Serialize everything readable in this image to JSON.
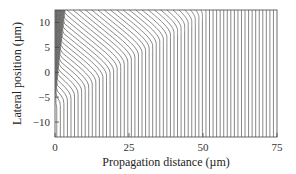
{
  "chart_data": {
    "type": "line",
    "title": "",
    "xlabel": "Propagation distance (µm)",
    "ylabel": "Lateral position (µm)",
    "xlim": [
      0,
      75
    ],
    "ylim": [
      -13,
      12.5
    ],
    "xticks": [
      0,
      25,
      50,
      75
    ],
    "xtick_labels": [
      "0",
      "25",
      "50",
      "75"
    ],
    "yticks": [
      -10,
      -5,
      0,
      5,
      10
    ],
    "ytick_labels": [
      "−10",
      "−5",
      "0",
      "5",
      "10"
    ],
    "grid": false,
    "legend": "none",
    "caustic": {
      "start": [
        0,
        -7
      ],
      "end": [
        52,
        12.5
      ]
    },
    "curve_count": 62,
    "curve_x_spacing": 1.2
  }
}
